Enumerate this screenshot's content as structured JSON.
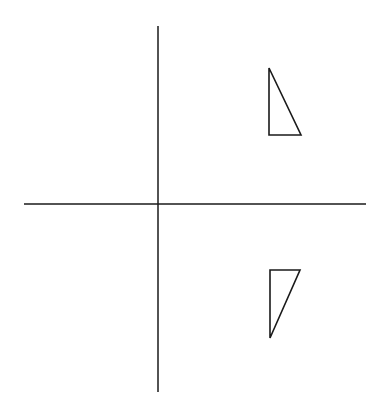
{
  "diagram": {
    "colors": {
      "background": "#ffffff",
      "stroke": "#1a1a1a"
    },
    "axes": {
      "horizontal": {
        "x1": 24,
        "y1": 204,
        "x2": 366,
        "y2": 204
      },
      "vertical": {
        "x1": 158,
        "y1": 26,
        "x2": 158,
        "y2": 392
      }
    },
    "shapes": [
      {
        "name": "triangle-original",
        "points": "269,68 269,135 301,135"
      },
      {
        "name": "triangle-reflected",
        "points": "270,270 300,270 270,338"
      }
    ]
  }
}
